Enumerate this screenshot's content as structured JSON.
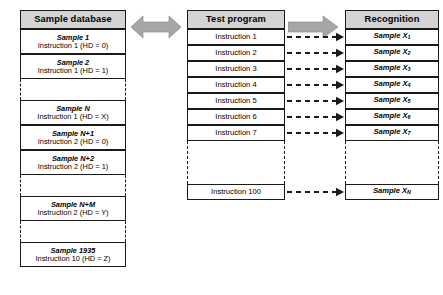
{
  "diagram": {
    "colors": {
      "header_fill": "#d4d4d4",
      "arrow_fill": "#a6a6a6",
      "stroke": "#1a1a1a",
      "background": "#ffffff"
    }
  },
  "sample_database": {
    "header": "Sample database",
    "rows": [
      {
        "kind": "entry",
        "sample": "Sample 1",
        "detail": "Instruction 1 (HD = 0)"
      },
      {
        "kind": "entry",
        "sample": "Sample 2",
        "detail": "Instruction 1 (HD = 1)"
      },
      {
        "kind": "gap",
        "sample": "",
        "detail": ""
      },
      {
        "kind": "entry",
        "sample": "Sample N",
        "detail": "Instruction 1 (HD = X)"
      },
      {
        "kind": "entry",
        "sample": "Sample N+1",
        "detail": "Instruction 2 (HD = 0)"
      },
      {
        "kind": "entry",
        "sample": "Sample N+2",
        "detail": "Instruction 2 (HD = 1)"
      },
      {
        "kind": "gap",
        "sample": "",
        "detail": ""
      },
      {
        "kind": "entry",
        "sample": "Sample N+M",
        "detail": "Instruction 2 (HD = Y)"
      },
      {
        "kind": "gap",
        "sample": "",
        "detail": ""
      },
      {
        "kind": "entry",
        "sample": "Sample 1935",
        "detail": "Instruction 10 (HD = Z)"
      }
    ]
  },
  "test_program": {
    "header": "Test program",
    "rows": [
      {
        "kind": "entry",
        "label": "Instruction 1"
      },
      {
        "kind": "entry",
        "label": "Instruction 2"
      },
      {
        "kind": "entry",
        "label": "Instruction 3"
      },
      {
        "kind": "entry",
        "label": "Instruction 4"
      },
      {
        "kind": "entry",
        "label": "Instruction 5"
      },
      {
        "kind": "entry",
        "label": "Instruction 6"
      },
      {
        "kind": "entry",
        "label": "Instruction 7"
      },
      {
        "kind": "gap",
        "label": ""
      },
      {
        "kind": "entry",
        "label": "Instruction 100"
      }
    ]
  },
  "recognition": {
    "header": "Recognition",
    "rows": [
      {
        "kind": "entry",
        "base": "Sample X",
        "sub": "1"
      },
      {
        "kind": "entry",
        "base": "Sample X",
        "sub": "2"
      },
      {
        "kind": "entry",
        "base": "Sample X",
        "sub": "3"
      },
      {
        "kind": "entry",
        "base": "Sample X",
        "sub": "4"
      },
      {
        "kind": "entry",
        "base": "Sample X",
        "sub": "5"
      },
      {
        "kind": "entry",
        "base": "Sample X",
        "sub": "6"
      },
      {
        "kind": "entry",
        "base": "Sample X",
        "sub": "7"
      },
      {
        "kind": "gap",
        "base": "",
        "sub": ""
      },
      {
        "kind": "entry",
        "base": "Sample X",
        "sub": "N"
      }
    ]
  },
  "connectors": {
    "database_to_program": {
      "style": "double-headed-block-arrow",
      "color": "#a6a6a6"
    },
    "program_to_recognition": {
      "style": "right-block-arrow",
      "color": "#a6a6a6"
    },
    "instruction_links": {
      "style": "dashed-arrow",
      "count": 8,
      "color": "#1a1a1a"
    }
  }
}
